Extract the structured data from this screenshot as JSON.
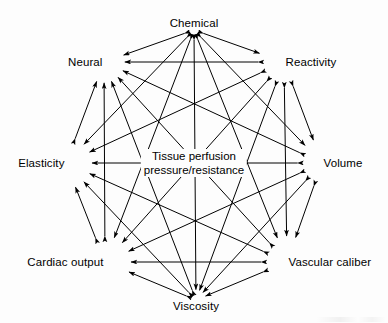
{
  "diagram": {
    "type": "complete-graph",
    "node_count": 8,
    "edge_style": "double-headed-arrow",
    "line_color": "#000000",
    "background_color": "#fdfdfd",
    "center_label": {
      "line1": "Tissue perfusion",
      "line2": "pressure/resistance"
    },
    "nodes": [
      {
        "id": "chemical",
        "label": "Chemical",
        "x": 194,
        "y": 30,
        "anchor": "n-top"
      },
      {
        "id": "reactivity",
        "label": "Reactivity",
        "x": 284,
        "y": 62,
        "anchor": "n-topright"
      },
      {
        "id": "volume",
        "label": "Volume",
        "x": 322,
        "y": 163,
        "anchor": "n-right"
      },
      {
        "id": "vascular-caliber",
        "label": "Vascular caliber",
        "x": 287,
        "y": 262,
        "anchor": "n-botright"
      },
      {
        "id": "viscosity",
        "label": "Viscosity",
        "x": 196,
        "y": 300,
        "anchor": "n-bottom"
      },
      {
        "id": "cardiac-output",
        "label": "Cardiac output",
        "x": 105,
        "y": 262,
        "anchor": "n-botleft"
      },
      {
        "id": "elasticity",
        "label": "Elasticity",
        "x": 66,
        "y": 163,
        "anchor": "n-left"
      },
      {
        "id": "neural",
        "label": "Neural",
        "x": 104,
        "y": 62,
        "anchor": "n-topleft"
      }
    ],
    "edges": [
      [
        "chemical",
        "reactivity"
      ],
      [
        "chemical",
        "volume"
      ],
      [
        "chemical",
        "vascular-caliber"
      ],
      [
        "chemical",
        "viscosity"
      ],
      [
        "chemical",
        "cardiac-output"
      ],
      [
        "chemical",
        "elasticity"
      ],
      [
        "chemical",
        "neural"
      ],
      [
        "reactivity",
        "volume"
      ],
      [
        "reactivity",
        "vascular-caliber"
      ],
      [
        "reactivity",
        "viscosity"
      ],
      [
        "reactivity",
        "cardiac-output"
      ],
      [
        "reactivity",
        "elasticity"
      ],
      [
        "reactivity",
        "neural"
      ],
      [
        "volume",
        "vascular-caliber"
      ],
      [
        "volume",
        "viscosity"
      ],
      [
        "volume",
        "cardiac-output"
      ],
      [
        "volume",
        "elasticity"
      ],
      [
        "volume",
        "neural"
      ],
      [
        "vascular-caliber",
        "viscosity"
      ],
      [
        "vascular-caliber",
        "cardiac-output"
      ],
      [
        "vascular-caliber",
        "elasticity"
      ],
      [
        "vascular-caliber",
        "neural"
      ],
      [
        "viscosity",
        "cardiac-output"
      ],
      [
        "viscosity",
        "elasticity"
      ],
      [
        "viscosity",
        "neural"
      ],
      [
        "cardiac-output",
        "elasticity"
      ],
      [
        "cardiac-output",
        "neural"
      ],
      [
        "elasticity",
        "neural"
      ]
    ]
  }
}
